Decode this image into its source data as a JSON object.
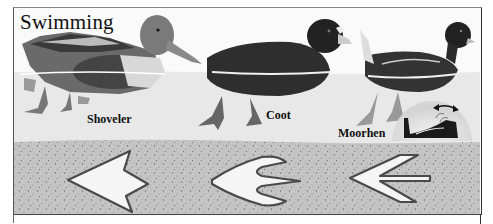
{
  "title": "Swimming",
  "birds": [
    {
      "name": "Shoveler",
      "label_x": 87,
      "label_y": 112
    },
    {
      "name": "Coot",
      "label_x": 266,
      "label_y": 108
    },
    {
      "name": "Moorhen",
      "label_x": 338,
      "label_y": 126
    }
  ],
  "footprints": [
    {
      "bird": "Shoveler",
      "type": "webbed"
    },
    {
      "bird": "Coot",
      "type": "lobed"
    },
    {
      "bird": "Moorhen",
      "type": "unwebbed"
    }
  ],
  "inset": {
    "description": "moorhen-head-bobbing-motion",
    "icon": "double-arrow-icon"
  },
  "colors": {
    "sky": "#fafafa",
    "water": "#e6e6e6",
    "sand": "#bdbdbd",
    "frame": "#444444"
  }
}
